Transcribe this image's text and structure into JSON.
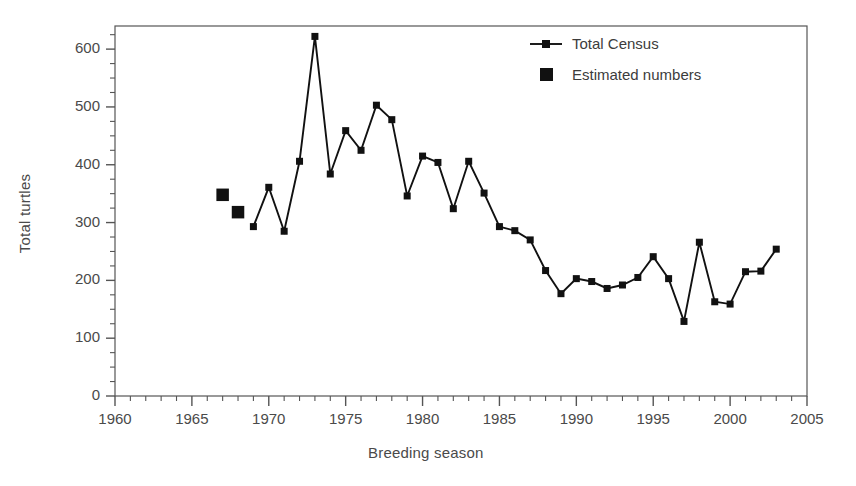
{
  "chart_data": {
    "type": "line",
    "title": "",
    "xlabel": "Breeding season",
    "ylabel": "Total turtles",
    "xlim": [
      1960,
      2005
    ],
    "ylim": [
      0,
      640
    ],
    "x_major_ticks": [
      1960,
      1965,
      1970,
      1975,
      1980,
      1985,
      1990,
      1995,
      2000,
      2005
    ],
    "x_minor_interval": 1,
    "y_major_ticks": [
      0,
      100,
      200,
      300,
      400,
      500,
      600
    ],
    "y_minor_interval": 25,
    "grid": false,
    "legend_position": "top-right",
    "marker": "square",
    "color": "#111111",
    "series": [
      {
        "name": "Total Census",
        "style": "line-with-square-markers",
        "points": [
          {
            "x": 1969,
            "y": 293
          },
          {
            "x": 1970,
            "y": 361
          },
          {
            "x": 1971,
            "y": 285
          },
          {
            "x": 1972,
            "y": 406
          },
          {
            "x": 1973,
            "y": 622
          },
          {
            "x": 1974,
            "y": 384
          },
          {
            "x": 1975,
            "y": 459
          },
          {
            "x": 1976,
            "y": 425
          },
          {
            "x": 1977,
            "y": 503
          },
          {
            "x": 1978,
            "y": 478
          },
          {
            "x": 1979,
            "y": 346
          },
          {
            "x": 1980,
            "y": 415
          },
          {
            "x": 1981,
            "y": 404
          },
          {
            "x": 1982,
            "y": 324
          },
          {
            "x": 1983,
            "y": 406
          },
          {
            "x": 1984,
            "y": 351
          },
          {
            "x": 1985,
            "y": 293
          },
          {
            "x": 1986,
            "y": 286
          },
          {
            "x": 1987,
            "y": 270
          },
          {
            "x": 1988,
            "y": 217
          },
          {
            "x": 1989,
            "y": 177
          },
          {
            "x": 1990,
            "y": 203
          },
          {
            "x": 1991,
            "y": 198
          },
          {
            "x": 1992,
            "y": 186
          },
          {
            "x": 1993,
            "y": 192
          },
          {
            "x": 1994,
            "y": 205
          },
          {
            "x": 1995,
            "y": 241
          },
          {
            "x": 1996,
            "y": 203
          },
          {
            "x": 1997,
            "y": 129
          },
          {
            "x": 1998,
            "y": 266
          },
          {
            "x": 1999,
            "y": 163
          },
          {
            "x": 2000,
            "y": 159
          },
          {
            "x": 2001,
            "y": 215
          },
          {
            "x": 2002,
            "y": 216
          },
          {
            "x": 2003,
            "y": 254
          }
        ]
      },
      {
        "name": "Estimated numbers",
        "style": "square-markers-only",
        "points": [
          {
            "x": 1967,
            "y": 348
          },
          {
            "x": 1968,
            "y": 318
          }
        ]
      }
    ]
  },
  "legend": {
    "entries": [
      {
        "label": "Total Census",
        "icon": "line-square-marker"
      },
      {
        "label": "Estimated numbers",
        "icon": "square-marker"
      }
    ]
  },
  "axes": {
    "y_title": "Total turtles",
    "x_title": "Breeding season",
    "y_tick_labels": [
      "0",
      "100",
      "200",
      "300",
      "400",
      "500",
      "600"
    ],
    "x_tick_labels": [
      "1960",
      "1965",
      "1970",
      "1975",
      "1980",
      "1985",
      "1990",
      "1995",
      "2000",
      "2005"
    ]
  },
  "colors": {
    "ink": "#111111",
    "frame": "#555555",
    "text": "#4a4a4a"
  }
}
